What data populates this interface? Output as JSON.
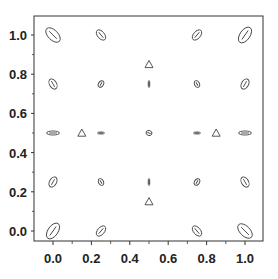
{
  "chart_data": {
    "type": "scatter",
    "title": "",
    "xlabel": "",
    "ylabel": "",
    "xlim": [
      -0.1,
      1.05
    ],
    "ylim": [
      -0.1,
      1.1
    ],
    "grid": false,
    "legend": null,
    "xticks": [
      "0.0",
      "0.2",
      "0.4",
      "0.6",
      "0.8",
      "1.0"
    ],
    "yticks": [
      "0.0",
      "0.2",
      "0.4",
      "0.6",
      "0.8",
      "1.0"
    ],
    "series": [
      {
        "name": "ellipses",
        "marker": "ellipse",
        "points": [
          {
            "x": 0.0,
            "y": 1.0,
            "rx": 5,
            "ry": 9,
            "rot": -45
          },
          {
            "x": 0.25,
            "y": 1.0,
            "rx": 3.5,
            "ry": 6,
            "rot": -40
          },
          {
            "x": 0.75,
            "y": 1.0,
            "rx": 3.5,
            "ry": 6,
            "rot": 40
          },
          {
            "x": 1.0,
            "y": 1.0,
            "rx": 5,
            "ry": 9,
            "rot": 35
          },
          {
            "x": 0.0,
            "y": 0.75,
            "rx": 3.5,
            "ry": 5.5,
            "rot": -30
          },
          {
            "x": 0.25,
            "y": 0.75,
            "rx": 2.5,
            "ry": 3.5,
            "rot": 30
          },
          {
            "x": 0.5,
            "y": 0.75,
            "rx": 0.8,
            "ry": 3.5,
            "rot": 0
          },
          {
            "x": 0.75,
            "y": 0.75,
            "rx": 2.5,
            "ry": 3.5,
            "rot": -30
          },
          {
            "x": 1.0,
            "y": 0.75,
            "rx": 3.5,
            "ry": 5.5,
            "rot": 30
          },
          {
            "x": 0.0,
            "y": 0.5,
            "rx": 6.5,
            "ry": 2,
            "rot": 0
          },
          {
            "x": 0.25,
            "y": 0.5,
            "rx": 3.5,
            "ry": 1,
            "rot": 0
          },
          {
            "x": 0.5,
            "y": 0.5,
            "rx": 3,
            "ry": 2.5,
            "rot": 20
          },
          {
            "x": 0.75,
            "y": 0.5,
            "rx": 3.5,
            "ry": 1,
            "rot": 0
          },
          {
            "x": 1.0,
            "y": 0.5,
            "rx": 6.5,
            "ry": 2,
            "rot": 0
          },
          {
            "x": 0.0,
            "y": 0.25,
            "rx": 3.5,
            "ry": 5.5,
            "rot": 30
          },
          {
            "x": 0.25,
            "y": 0.25,
            "rx": 2.5,
            "ry": 3.5,
            "rot": -30
          },
          {
            "x": 0.5,
            "y": 0.25,
            "rx": 0.8,
            "ry": 3.5,
            "rot": 0
          },
          {
            "x": 0.75,
            "y": 0.25,
            "rx": 2.5,
            "ry": 3.5,
            "rot": 30
          },
          {
            "x": 1.0,
            "y": 0.25,
            "rx": 3.5,
            "ry": 5.5,
            "rot": -30
          },
          {
            "x": 0.0,
            "y": 0.0,
            "rx": 5,
            "ry": 9,
            "rot": 35
          },
          {
            "x": 0.25,
            "y": 0.0,
            "rx": 3.5,
            "ry": 6,
            "rot": 40
          },
          {
            "x": 0.75,
            "y": 0.0,
            "rx": 3.5,
            "ry": 6,
            "rot": -40
          },
          {
            "x": 1.0,
            "y": 0.0,
            "rx": 5,
            "ry": 9,
            "rot": -45
          }
        ]
      },
      {
        "name": "triangles",
        "marker": "triangle-open",
        "points": [
          {
            "x": 0.5,
            "y": 0.85
          },
          {
            "x": 0.15,
            "y": 0.5
          },
          {
            "x": 0.85,
            "y": 0.5
          },
          {
            "x": 0.5,
            "y": 0.15
          }
        ]
      }
    ]
  }
}
